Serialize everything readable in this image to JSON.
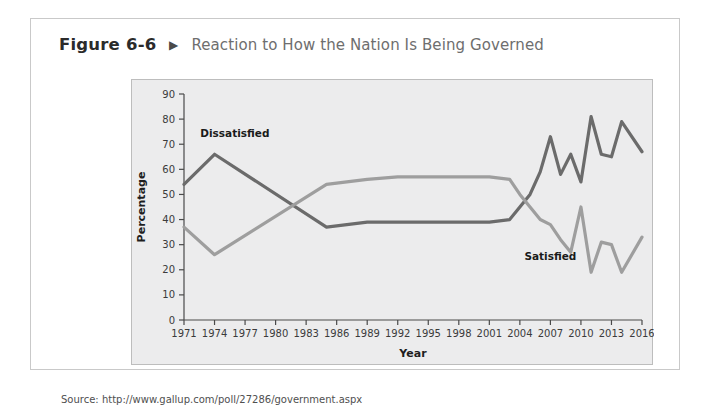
{
  "figure": {
    "number": "Figure 6-6",
    "arrow_icon": "triangle-right-icon",
    "title": "Reaction to How the Nation Is Being Governed",
    "source": "Source: http://www.gallup.com/poll/27286/government.aspx"
  },
  "colors": {
    "dissatisfied_line": "#6b6b6b",
    "satisfied_line": "#9e9e9e",
    "panel_background": "#ececed",
    "panel_border": "#bdbdbd",
    "card_border": "#c9c9c9",
    "axis": "#4a4a4a",
    "title_text": "#6e6e6e",
    "number_text": "#2b2b2b"
  },
  "chart_data": {
    "type": "line",
    "title": "Reaction to How the Nation Is Being Governed",
    "xlabel": "Year",
    "ylabel": "Percentage",
    "xlim": [
      1971,
      2016
    ],
    "ylim": [
      0,
      90
    ],
    "yticks": [
      0,
      10,
      20,
      30,
      40,
      50,
      60,
      70,
      80,
      90
    ],
    "xticks": [
      1971,
      1974,
      1977,
      1980,
      1983,
      1986,
      1989,
      1992,
      1995,
      1998,
      2001,
      2004,
      2007,
      2010,
      2013,
      2016
    ],
    "grid": false,
    "legend": "inline-annotations",
    "series": [
      {
        "name": "Dissatisfied",
        "color": "#6b6b6b",
        "label_position": {
          "x": 1976,
          "y": 73
        },
        "points": [
          {
            "x": 1971,
            "y": 54
          },
          {
            "x": 1974,
            "y": 66
          },
          {
            "x": 1985,
            "y": 37
          },
          {
            "x": 1989,
            "y": 39
          },
          {
            "x": 1992,
            "y": 39
          },
          {
            "x": 2001,
            "y": 39
          },
          {
            "x": 2003,
            "y": 40
          },
          {
            "x": 2004,
            "y": 45
          },
          {
            "x": 2005,
            "y": 50
          },
          {
            "x": 2006,
            "y": 59
          },
          {
            "x": 2007,
            "y": 73
          },
          {
            "x": 2008,
            "y": 58
          },
          {
            "x": 2009,
            "y": 66
          },
          {
            "x": 2010,
            "y": 55
          },
          {
            "x": 2011,
            "y": 81
          },
          {
            "x": 2012,
            "y": 66
          },
          {
            "x": 2013,
            "y": 65
          },
          {
            "x": 2014,
            "y": 79
          },
          {
            "x": 2016,
            "y": 67
          }
        ]
      },
      {
        "name": "Satisfied",
        "color": "#9e9e9e",
        "label_position": {
          "x": 2007,
          "y": 24
        },
        "points": [
          {
            "x": 1971,
            "y": 37
          },
          {
            "x": 1974,
            "y": 26
          },
          {
            "x": 1985,
            "y": 54
          },
          {
            "x": 1989,
            "y": 56
          },
          {
            "x": 1992,
            "y": 57
          },
          {
            "x": 2001,
            "y": 57
          },
          {
            "x": 2003,
            "y": 56
          },
          {
            "x": 2004,
            "y": 50
          },
          {
            "x": 2005,
            "y": 45
          },
          {
            "x": 2006,
            "y": 40
          },
          {
            "x": 2007,
            "y": 38
          },
          {
            "x": 2008,
            "y": 32
          },
          {
            "x": 2009,
            "y": 27
          },
          {
            "x": 2010,
            "y": 45
          },
          {
            "x": 2011,
            "y": 19
          },
          {
            "x": 2012,
            "y": 31
          },
          {
            "x": 2013,
            "y": 30
          },
          {
            "x": 2014,
            "y": 19
          },
          {
            "x": 2016,
            "y": 33
          }
        ]
      }
    ]
  }
}
